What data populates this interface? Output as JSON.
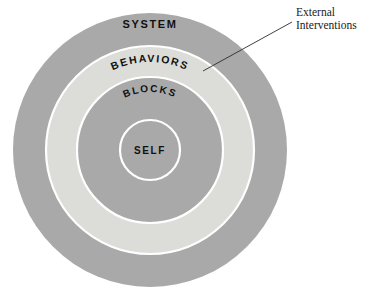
{
  "diagram": {
    "center": {
      "x": 150,
      "y": 150
    },
    "background_color": "#ffffff",
    "divider_color": "#ffffff",
    "rings": [
      {
        "id": "system",
        "label": "SYSTEM",
        "radius": 137,
        "fill": "#a9a9a9",
        "label_placement": "top-horizontal",
        "label_x": 150,
        "label_y": 28,
        "font_size": 11
      },
      {
        "id": "behaviors",
        "label": "BEHAVIORS",
        "radius": 104,
        "fill": "#dcdcd8",
        "label_placement": "arc",
        "label_radius": 88,
        "label_offset": 52,
        "font_size": 10.5
      },
      {
        "id": "blocks",
        "label": "BLOCKS",
        "radius": 73,
        "fill": "#a9a9a9",
        "label_placement": "arc",
        "label_radius": 58,
        "label_offset": 36,
        "font_size": 10
      },
      {
        "id": "self",
        "label": "SELF",
        "radius": 30,
        "fill": "#a9a9a9",
        "label_placement": "center-horizontal",
        "label_x": 150,
        "label_y": 154,
        "font_size": 10
      }
    ]
  },
  "callout": {
    "id": "external-interventions",
    "lines": [
      "External",
      "Interventions"
    ],
    "text_x": 296,
    "text_line1_y": 16,
    "text_line2_y": 29,
    "leader": {
      "from_x": 292,
      "from_y": 22,
      "to_x": 203,
      "to_y": 71,
      "color": "#2b2b2b"
    }
  },
  "colors": {
    "ring_dark": "#a9a9a9",
    "ring_light": "#dcdcd8",
    "text": "#111111",
    "callout_text": "#1a1a1a",
    "leader": "#2b2b2b",
    "divider": "#ffffff"
  }
}
